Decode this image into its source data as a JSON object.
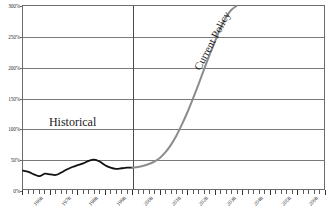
{
  "chart_data": {
    "type": "line",
    "title": "",
    "xlabel": "",
    "ylabel": "",
    "xlim": [
      1968,
      2078
    ],
    "ylim": [
      0,
      300
    ],
    "grid": true,
    "legend_position": "inline-annotations",
    "ytick_labels": [
      "0%",
      "50%",
      "100%",
      "150%",
      "200%",
      "250%",
      "300%"
    ],
    "ytick_values": [
      0,
      50,
      100,
      150,
      200,
      250,
      300
    ],
    "xtick_labels": [
      "1968",
      "1978",
      "1988",
      "1998",
      "2008",
      "2018",
      "2028",
      "2038",
      "2048",
      "2058",
      "2068",
      "2078"
    ],
    "xtick_values": [
      1968,
      1978,
      1988,
      1998,
      2008,
      2018,
      2028,
      2038,
      2048,
      2058,
      2068,
      2078
    ],
    "minor_tick_interval": 2,
    "divider_x": 2008,
    "annotations": [
      {
        "text": "Historical",
        "x": 1986,
        "y": 112
      },
      {
        "text": "Current Policy",
        "x": 2033,
        "y": 212,
        "rotation": -62
      }
    ],
    "series": [
      {
        "name": "Historical",
        "color": "#111111",
        "width": 1.8,
        "x": [
          1968,
          1970,
          1972,
          1974,
          1976,
          1978,
          1980,
          1982,
          1984,
          1986,
          1988,
          1990,
          1992,
          1994,
          1996,
          1998,
          2000,
          2002,
          2004,
          2006,
          2008
        ],
        "values": [
          30,
          28,
          24,
          21,
          25,
          24,
          23,
          27,
          32,
          36,
          39,
          42,
          46,
          48,
          45,
          39,
          35,
          33,
          34,
          35,
          35
        ]
      },
      {
        "name": "Current Policy",
        "color": "#8c8c8c",
        "width": 2.0,
        "x": [
          2008,
          2010,
          2012,
          2014,
          2016,
          2018,
          2020,
          2022,
          2024,
          2026,
          2028,
          2030,
          2032,
          2034,
          2036,
          2038,
          2040,
          2042,
          2044,
          2046
        ],
        "values": [
          35,
          36,
          38,
          41,
          45,
          51,
          60,
          72,
          87,
          105,
          125,
          147,
          170,
          194,
          218,
          240,
          262,
          280,
          293,
          300
        ]
      }
    ]
  }
}
